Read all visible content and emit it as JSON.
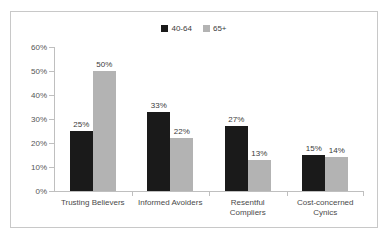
{
  "chart_data": {
    "type": "bar",
    "title": "",
    "subtitle": "",
    "xlabel": "",
    "ylabel": "",
    "ylim": [
      0,
      60
    ],
    "ytick_labels": [
      "0%",
      "10%",
      "20%",
      "30%",
      "40%",
      "50%",
      "60%"
    ],
    "ytick_values": [
      0,
      10,
      20,
      30,
      40,
      50,
      60
    ],
    "grid": false,
    "legend_position": "top-center",
    "categories": [
      "Trusting Believers",
      "Informed Avoiders",
      "Resentful\nCompliers",
      "Cost-concerned\nCynics"
    ],
    "series": [
      {
        "name": "40-64",
        "color": "#1a1a1a",
        "values": [
          25,
          33,
          27,
          15
        ],
        "labels": [
          "25%",
          "33%",
          "27%",
          "15%"
        ]
      },
      {
        "name": "65+",
        "color": "#b3b3b3",
        "values": [
          50,
          22,
          13,
          14
        ],
        "labels": [
          "50%",
          "22%",
          "13%",
          "14%"
        ]
      }
    ]
  },
  "legend": {
    "entries": [
      {
        "label": "40-64"
      },
      {
        "label": "65+"
      }
    ]
  },
  "colors": {
    "series_0": "#1a1a1a",
    "series_1": "#b3b3b3",
    "axis": "#bfbfbf",
    "border": "#c8c8c8",
    "text": "#3b3b3b"
  }
}
